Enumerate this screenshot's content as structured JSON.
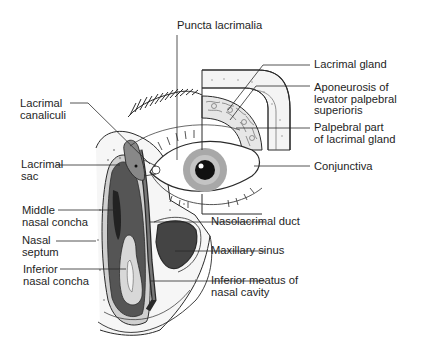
{
  "diagram": {
    "colors": {
      "background": "#ffffff",
      "line": "#2a2a2a",
      "dark_fill": "#4a4a4a",
      "mid_fill": "#8a8a8a",
      "light_fill": "#d9d9d9",
      "iris": "#9a9a9a",
      "pupil": "#111111"
    },
    "labels": {
      "puncta": {
        "line1": "Puncta lacrimalia"
      },
      "lacrimal_gland": {
        "line1": "Lacrimal gland"
      },
      "aponeurosis": {
        "line1": "Aponeurosis of",
        "line2": "levator palpebral",
        "line3": "superioris"
      },
      "palpebral_part": {
        "line1": "Palpebral part",
        "line2": "of lacrimal gland"
      },
      "conjunctiva": {
        "line1": "Conjunctiva"
      },
      "canaliculi": {
        "line1": "Lacrimal",
        "line2": "canaliculi"
      },
      "sac": {
        "line1": "Lacrimal",
        "line2": "sac"
      },
      "middle_concha": {
        "line1": "Middle",
        "line2": "nasal concha"
      },
      "septum": {
        "line1": "Nasal",
        "line2": "septum"
      },
      "inferior_concha": {
        "line1": "Inferior",
        "line2": "nasal concha"
      },
      "nasolacrimal_duct": {
        "line1": "Nasolacrimal duct"
      },
      "maxillary_sinus": {
        "line1": "Maxillary sinus"
      },
      "inferior_meatus": {
        "line1": "Inferior meatus of",
        "line2": "nasal cavity"
      }
    }
  }
}
